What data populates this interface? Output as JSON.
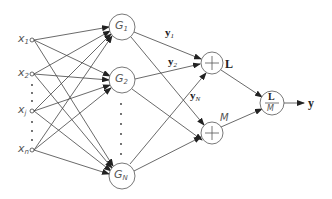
{
  "diagram": {
    "inputs": [
      {
        "id": "x1",
        "label": "x",
        "sub": "1"
      },
      {
        "id": "x2",
        "label": "x",
        "sub": "2"
      },
      {
        "id": "xj",
        "label": "x",
        "sub": "j"
      },
      {
        "id": "xn",
        "label": "x",
        "sub": "n"
      }
    ],
    "hidden_nodes": [
      {
        "id": "G1",
        "label": "G",
        "sub": "1"
      },
      {
        "id": "G2",
        "label": "G",
        "sub": "2"
      },
      {
        "id": "GN",
        "label": "G",
        "sub": "N"
      }
    ],
    "edge_labels": {
      "y1": {
        "label": "y",
        "sub": "1"
      },
      "y2": {
        "label": "y",
        "sub": "2"
      },
      "yN": {
        "label": "y",
        "sub": "N"
      }
    },
    "sum_nodes": [
      {
        "id": "sumL",
        "symbol": "+",
        "output_label": "L"
      },
      {
        "id": "sumM",
        "symbol": "+",
        "output_label": "M"
      }
    ],
    "divide_node": {
      "numerator": "L",
      "denominator": "M"
    },
    "output": {
      "label": "y"
    }
  }
}
